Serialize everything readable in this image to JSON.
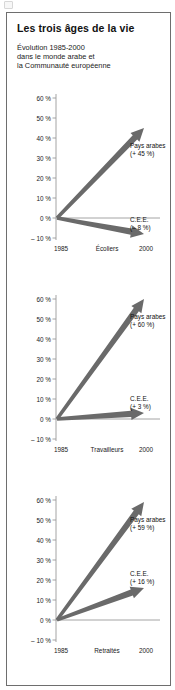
{
  "document": {
    "title": "Les trois âges de la vie",
    "subtitle_lines": [
      "Évolution 1985-2000",
      "dans le monde arabe et",
      "la Communauté européenne"
    ]
  },
  "colors": {
    "frame": "#6e6e6e",
    "arrow": "#6a6a6a",
    "axis": "#9a9a9a",
    "text": "#111111",
    "background": "#ffffff"
  },
  "axis": {
    "yticks": [
      "60 %",
      "50 %",
      "40 %",
      "30 %",
      "20 %",
      "10 %",
      "0 %",
      "– 10 %"
    ],
    "ytick_values": [
      60,
      50,
      40,
      30,
      20,
      10,
      0,
      -10
    ],
    "xticks": [
      "1985",
      "2000"
    ]
  },
  "chart_data": [
    {
      "type": "line",
      "title": "Écoliers",
      "xlabel": "Écoliers",
      "ylabel": "%",
      "x": [
        "1985",
        "2000"
      ],
      "ylim": [
        -10,
        60
      ],
      "grid": false,
      "legend": "inline-annotations",
      "series": [
        {
          "name": "Pays arabes",
          "label": "Pays arabes",
          "value_label": "(+ 45 %)",
          "values": [
            0,
            45
          ]
        },
        {
          "name": "C.E.E.",
          "label": "C.E.E.",
          "value_label": "(– 8 %)",
          "values": [
            0,
            -8
          ]
        }
      ]
    },
    {
      "type": "line",
      "title": "Travailleurs",
      "xlabel": "Travailleurs",
      "ylabel": "%",
      "x": [
        "1985",
        "2000"
      ],
      "ylim": [
        -10,
        60
      ],
      "grid": false,
      "legend": "inline-annotations",
      "series": [
        {
          "name": "Pays arabes",
          "label": "Pays arabes",
          "value_label": "(+ 60 %)",
          "values": [
            0,
            60
          ]
        },
        {
          "name": "C.E.E.",
          "label": "C.E.E.",
          "value_label": "(+ 3 %)",
          "values": [
            0,
            3
          ]
        }
      ]
    },
    {
      "type": "line",
      "title": "Retraités",
      "xlabel": "Retraités",
      "ylabel": "%",
      "x": [
        "1985",
        "2000"
      ],
      "ylim": [
        -10,
        60
      ],
      "grid": false,
      "legend": "inline-annotations",
      "series": [
        {
          "name": "Pays arabes",
          "label": "Pays arabes",
          "value_label": "(+ 59 %)",
          "values": [
            0,
            59
          ]
        },
        {
          "name": "C.E.E.",
          "label": "C.E.E.",
          "value_label": "(+ 16 %)",
          "values": [
            0,
            16
          ]
        }
      ]
    }
  ]
}
